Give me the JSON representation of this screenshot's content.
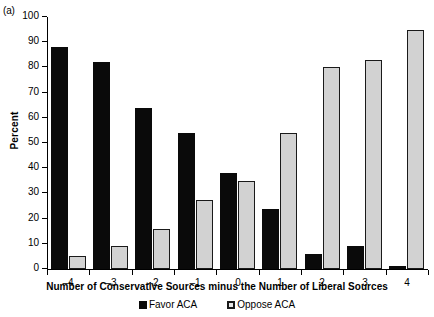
{
  "panel": {
    "label": "(a)"
  },
  "legend": {
    "position": "bottom-center",
    "items": [
      {
        "label": "Favor ACA",
        "marker": "filled-square-icon",
        "color": "#0a0a0a"
      },
      {
        "label": "Oppose ACA",
        "marker": "open-square-icon",
        "color": "#e8e8e8"
      }
    ]
  },
  "chart_data": {
    "type": "bar",
    "title": "",
    "subtitle": "",
    "xlabel": "Number of Conservative Sources minus the Number of Liberal Sources",
    "ylabel": "Percent",
    "categories": [
      "-4",
      "-3",
      "-2",
      "-1",
      "0",
      "1",
      "2",
      "3",
      "4"
    ],
    "xtick_labels": [
      "–4",
      "–3",
      "–2",
      "–1",
      "0",
      "1",
      "2",
      "3",
      "4"
    ],
    "ytick_labels": [
      "0",
      "10",
      "20",
      "30",
      "40",
      "50",
      "60",
      "70",
      "80",
      "90",
      "100"
    ],
    "ytick_values": [
      0,
      10,
      20,
      30,
      40,
      50,
      60,
      70,
      80,
      90,
      100
    ],
    "ylim": [
      0,
      100
    ],
    "grid": false,
    "legend_position": "bottom-center",
    "series": [
      {
        "name": "Favor ACA",
        "color": "#0a0a0a",
        "values": [
          88,
          82,
          64,
          54,
          38,
          24,
          6,
          9,
          1
        ]
      },
      {
        "name": "Oppose ACA",
        "color": "#d2d2d2",
        "values": [
          5,
          9,
          16,
          27.5,
          35,
          54,
          80,
          83,
          95
        ]
      }
    ]
  }
}
